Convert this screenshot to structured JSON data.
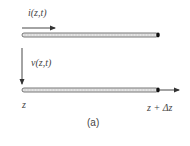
{
  "diagram": {
    "type": "transmission-line-segment",
    "current_label": "i(z,t)",
    "voltage_label": "v(z,t)",
    "left_position_label": "z",
    "right_position_label": "z + Δz",
    "caption": "(a)",
    "conductors": [
      {
        "name": "top-conductor",
        "x_start": 22,
        "x_end": 158,
        "y": 35
      },
      {
        "name": "bottom-conductor",
        "x_start": 22,
        "x_end": 158,
        "y": 90
      }
    ],
    "arrows": [
      {
        "name": "current-arrow",
        "direction": "right"
      },
      {
        "name": "voltage-arrow",
        "direction": "down"
      },
      {
        "name": "z-axis-arrow",
        "direction": "right"
      }
    ],
    "colors": {
      "line": "#333333",
      "conductor_fill": "#dddddd",
      "end_cap": "#111111",
      "background": "#ffffff"
    }
  }
}
